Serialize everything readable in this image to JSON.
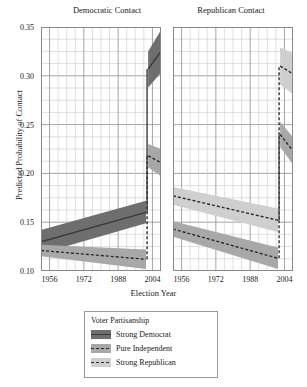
{
  "figure": {
    "ylabel": "Predicted Probability of Contact",
    "xlabel": "Election Year"
  },
  "panels": {
    "democratic": {
      "title": "Democratic Contact"
    },
    "republican": {
      "title": "Republican Contact"
    }
  },
  "legend": {
    "title": "Voter Partisanship",
    "items": [
      {
        "label": "Strong Democrat",
        "color": "#3a3a3a",
        "band": "#6e6e6e",
        "style": "solid"
      },
      {
        "label": "Pure Independent",
        "color": "#2b2b2b",
        "band": "#a8a8a8",
        "style": "dashed"
      },
      {
        "label": "Strong Republican",
        "color": "#2b2b2b",
        "band": "#cfcfcf",
        "style": "dashed"
      }
    ]
  },
  "axes": {
    "y": {
      "min": 0.1,
      "max": 0.35,
      "ticks": [
        0.35,
        0.3,
        0.25,
        0.2,
        0.15,
        0.1
      ],
      "tick_labels": [
        "0.35",
        "0.30",
        "0.25",
        "0.20",
        "0.15",
        "0.10"
      ],
      "minor_step": 0.0125
    },
    "x": {
      "min": 1952,
      "max": 2008,
      "ticks": [
        1956,
        1972,
        1988,
        2004
      ],
      "tick_labels": [
        "1956",
        "1972",
        "1988",
        "2004"
      ],
      "minor_step": 4
    }
  },
  "chart_data": {
    "type": "line",
    "xlabel": "Election Year",
    "ylabel": "Predicted Probability of Contact",
    "xlim": [
      1952,
      2008
    ],
    "ylim": [
      0.1,
      0.35
    ],
    "grid": true,
    "legend_position": "bottom-center",
    "note": "Two panels; each series is broken at 2002 with a discontinuity (regime change). Shaded ribbons are confidence intervals.",
    "panels": [
      {
        "name": "Democratic Contact",
        "series": [
          {
            "name": "Strong Democrat",
            "style": "solid",
            "color": "#3a3a3a",
            "segments": [
              {
                "x": [
                  1952,
                  2001
                ],
                "y": [
                  0.13,
                  0.16
                ],
                "lo": [
                  0.118,
                  0.149
                ],
                "hi": [
                  0.142,
                  0.172
                ]
              },
              {
                "x": [
                  2002,
                  2008
                ],
                "y": [
                  0.307,
                  0.325
                ],
                "lo": [
                  0.288,
                  0.303
                ],
                "hi": [
                  0.325,
                  0.347
                ]
              }
            ]
          },
          {
            "name": "Pure Independent",
            "style": "dashed",
            "color": "#2b2b2b",
            "segments": [
              {
                "x": [
                  1952,
                  2001
                ],
                "y": [
                  0.121,
                  0.112
                ],
                "lo": [
                  0.115,
                  0.102
                ],
                "hi": [
                  0.127,
                  0.122
                ]
              },
              {
                "x": [
                  2002,
                  2008
                ],
                "y": [
                  0.218,
                  0.211
                ],
                "lo": [
                  0.206,
                  0.197
                ],
                "hi": [
                  0.23,
                  0.225
                ]
              }
            ]
          }
        ]
      },
      {
        "name": "Republican Contact",
        "series": [
          {
            "name": "Strong Republican",
            "style": "dashed",
            "color": "#2b2b2b",
            "segments": [
              {
                "x": [
                  1952,
                  2001
                ],
                "y": [
                  0.177,
                  0.152
                ],
                "lo": [
                  0.168,
                  0.14
                ],
                "hi": [
                  0.186,
                  0.164
                ]
              },
              {
                "x": [
                  2002,
                  2008
                ],
                "y": [
                  0.31,
                  0.302
                ],
                "lo": [
                  0.291,
                  0.281
                ],
                "hi": [
                  0.329,
                  0.323
                ]
              }
            ]
          },
          {
            "name": "Pure Independent",
            "style": "dashed",
            "color": "#2b2b2b",
            "segments": [
              {
                "x": [
                  1952,
                  2001
                ],
                "y": [
                  0.143,
                  0.113
                ],
                "lo": [
                  0.135,
                  0.102
                ],
                "hi": [
                  0.151,
                  0.124
                ]
              },
              {
                "x": [
                  2002,
                  2008
                ],
                "y": [
                  0.24,
                  0.223
                ],
                "lo": [
                  0.227,
                  0.209
                ],
                "hi": [
                  0.253,
                  0.237
                ]
              }
            ]
          }
        ]
      }
    ]
  }
}
